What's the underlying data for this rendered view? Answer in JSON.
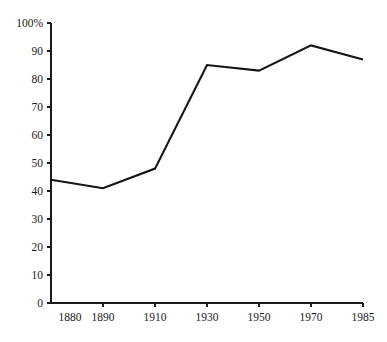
{
  "chart_data": {
    "type": "line",
    "title": "",
    "subtitle": "",
    "xlabel": "",
    "ylabel": "",
    "categories": [
      "1880",
      "1890",
      "1910",
      "1930",
      "1950",
      "1970",
      "1985"
    ],
    "values": [
      44,
      41,
      48,
      85,
      83,
      92,
      87
    ],
    "series": [
      {
        "name": "",
        "values": [
          44,
          41,
          48,
          85,
          83,
          92,
          87
        ],
        "color": "#141414"
      }
    ],
    "ylim": [
      0,
      100
    ],
    "y_ticks": [
      0,
      10,
      20,
      30,
      40,
      50,
      60,
      70,
      80,
      90,
      100
    ],
    "y_tick_labels": [
      "0",
      "10",
      "20",
      "30",
      "40",
      "50",
      "60",
      "70",
      "80",
      "90",
      "100%"
    ],
    "x_tick_labels": [
      "1880",
      "1890",
      "1910",
      "1930",
      "1950",
      "1970",
      "1985"
    ],
    "grid": false,
    "legend": false,
    "legend_position": "none",
    "annotations": []
  },
  "style": {
    "background": "#ffffff",
    "axis_color": "#1a1a1a",
    "line_color": "#141414",
    "text_color": "#1a1a1a"
  },
  "geometry": {
    "plot_left": 51,
    "plot_right": 363,
    "plot_top": 23,
    "plot_bottom": 303,
    "first_point_x": 51,
    "x_step": 52
  }
}
